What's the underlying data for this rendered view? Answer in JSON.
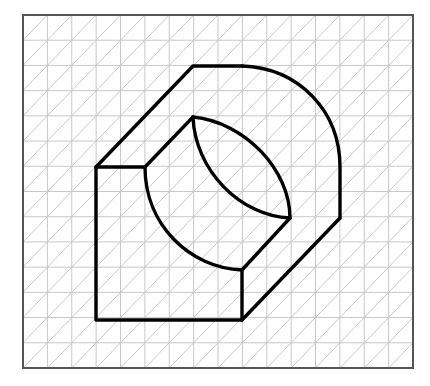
{
  "diagram": {
    "type": "isometric-sketch-on-triangular-grid",
    "colors": {
      "background": "#ffffff",
      "grid": "#c8c8c8",
      "frame": "#555555",
      "outline": "#000000"
    },
    "frame": {
      "x": 23,
      "y": 15,
      "width": 390,
      "height": 353
    },
    "grid": {
      "columns": 16,
      "rows": 14,
      "diagonals": "45-degree, bottom-left to top-right in each cell"
    },
    "shape": {
      "outer_left_vertical": [
        [
          96,
          167
        ],
        [
          96,
          320
        ]
      ],
      "outer_bottom": [
        [
          96,
          320
        ],
        [
          242,
          320
        ]
      ],
      "front_right_vertical": [
        [
          242,
          320
        ],
        [
          242,
          270
        ]
      ],
      "front_top": [
        [
          96,
          167
        ],
        [
          145,
          167
        ]
      ],
      "top_left_diagonal": [
        [
          96,
          167
        ],
        [
          193,
          66
        ]
      ],
      "top_edge": [
        [
          193,
          66
        ],
        [
          242,
          66
        ]
      ],
      "outer_arc": {
        "from": [
          242,
          66
        ],
        "to": [
          340,
          167
        ]
      },
      "right_vertical": [
        [
          340,
          167
        ],
        [
          340,
          218
        ]
      ],
      "bottom_right_diagonal": [
        [
          340,
          218
        ],
        [
          242,
          320
        ]
      ],
      "inner_diagonal": [
        [
          145,
          167
        ],
        [
          193,
          117
        ]
      ],
      "front_arc": {
        "from": [
          145,
          167
        ],
        "to": [
          242,
          270
        ]
      },
      "lens_arc_upper": {
        "from": [
          193,
          117
        ],
        "to": [
          290,
          218
        ]
      },
      "lens_arc_lower": {
        "from": [
          193,
          117
        ],
        "to": [
          290,
          218
        ]
      },
      "inner_right_diagonal": [
        [
          290,
          218
        ],
        [
          242,
          270
        ]
      ]
    }
  }
}
